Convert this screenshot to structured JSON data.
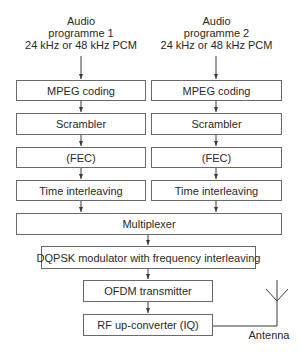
{
  "diagram": {
    "inputs": [
      {
        "line1": "Audio",
        "line2": "programme 1",
        "line3": "24 kHz or 48 kHz PCM"
      },
      {
        "line1": "Audio",
        "line2": "programme 2",
        "line3": "24 kHz or 48 kHz PCM"
      }
    ],
    "chains": [
      {
        "mpeg": "MPEG coding",
        "scrambler": "Scrambler",
        "fec": "(FEC)",
        "interleave": "Time interleaving"
      },
      {
        "mpeg": "MPEG coding",
        "scrambler": "Scrambler",
        "fec": "(FEC)",
        "interleave": "Time interleaving"
      }
    ],
    "multiplexer": "Multiplexer",
    "modulator": "DQPSK modulator with frequency interleaving",
    "ofdm": "OFDM transmitter",
    "rf": "RF up-converter (IQ)",
    "antenna_label": "Antenna",
    "caption": ""
  },
  "colors": {
    "line": "#3a3a3a",
    "box_border": "#6a6a6a",
    "text": "#2a2a2a"
  }
}
